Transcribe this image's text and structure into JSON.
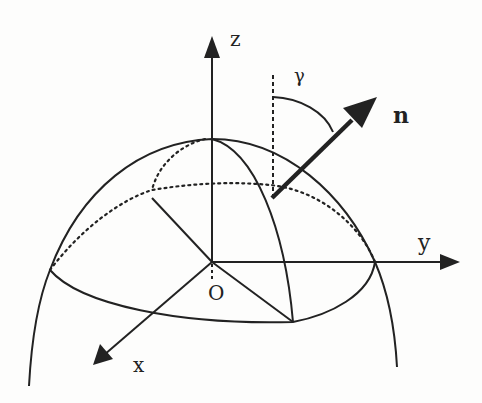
{
  "figure": {
    "labels": {
      "z_axis": "z",
      "y_axis": "y",
      "x_axis": "x",
      "origin": "O",
      "normal_vector": "n",
      "angle": "γ"
    },
    "colors": {
      "ink": "#222222",
      "background": "#fdfdfc"
    }
  }
}
